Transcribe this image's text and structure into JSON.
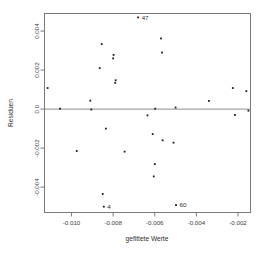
{
  "chart_data": {
    "type": "scatter",
    "title": "",
    "xlabel": "gefittete Werte",
    "ylabel": "Residuen",
    "xlim": [
      -0.0113,
      -0.0014
    ],
    "ylim": [
      -0.0053,
      0.0049
    ],
    "grid": false,
    "legend": null,
    "xticks": [
      -0.01,
      -0.008,
      -0.006,
      -0.004,
      -0.002
    ],
    "xtick_labels": [
      "-0.010",
      "-0.008",
      "-0.006",
      "-0.004",
      "-0.002"
    ],
    "yticks": [
      0.004,
      0.002,
      0.0,
      -0.002,
      -0.004
    ],
    "ytick_labels": [
      "0.004",
      "0.002",
      "0.0",
      "-0.002",
      "-0.004"
    ],
    "reference_lines": [
      {
        "orientation": "horizontal",
        "value": 0.0
      }
    ],
    "marker": "dot",
    "marker_color": "#1c1c1c",
    "points": [
      {
        "x": -0.01115,
        "y": 0.00108
      },
      {
        "x": -0.01055,
        "y": 2e-05
      },
      {
        "x": -0.00975,
        "y": -0.00215
      },
      {
        "x": -0.0091,
        "y": 0.00043
      },
      {
        "x": -0.00905,
        "y": -2e-05
      },
      {
        "x": -0.00865,
        "y": 0.0021
      },
      {
        "x": -0.00855,
        "y": 0.00333
      },
      {
        "x": -0.0085,
        "y": -0.00435
      },
      {
        "x": -0.00845,
        "y": -0.005
      },
      {
        "x": -0.00835,
        "y": -0.001
      },
      {
        "x": -0.008,
        "y": 0.0026
      },
      {
        "x": -0.00798,
        "y": 0.00278
      },
      {
        "x": -0.0079,
        "y": 0.00135
      },
      {
        "x": -0.00788,
        "y": 0.00148
      },
      {
        "x": -0.00745,
        "y": -0.00218
      },
      {
        "x": -0.0068,
        "y": 0.0047
      },
      {
        "x": -0.00635,
        "y": -0.00032
      },
      {
        "x": -0.0061,
        "y": -0.00128
      },
      {
        "x": -0.00605,
        "y": -0.00345
      },
      {
        "x": -0.006,
        "y": -0.00282
      },
      {
        "x": -0.00598,
        "y": 2e-05
      },
      {
        "x": -0.0057,
        "y": 0.00362
      },
      {
        "x": -0.00565,
        "y": 0.0029
      },
      {
        "x": -0.00562,
        "y": -0.0016
      },
      {
        "x": -0.0051,
        "y": -0.00172
      },
      {
        "x": -0.005,
        "y": 8e-05
      },
      {
        "x": -0.00498,
        "y": -0.00492
      },
      {
        "x": -0.0034,
        "y": 0.00042
      },
      {
        "x": -0.00225,
        "y": 0.00108
      },
      {
        "x": -0.00215,
        "y": -0.0003
      },
      {
        "x": -0.0016,
        "y": 0.00092
      },
      {
        "x": -0.0015,
        "y": -8e-05
      }
    ],
    "annotations": [
      {
        "text": "47",
        "x": -0.0068,
        "y": 0.0047,
        "position": "right"
      },
      {
        "text": "60",
        "x": -0.00498,
        "y": -0.00492,
        "position": "right"
      },
      {
        "text": "4",
        "x": -0.00845,
        "y": -0.005,
        "position": "right"
      }
    ]
  }
}
